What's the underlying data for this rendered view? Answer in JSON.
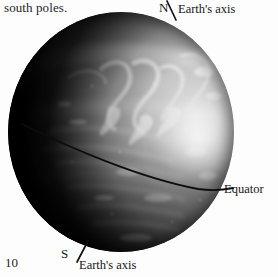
{
  "page": {
    "folio": "10",
    "background_color": "#ffffff",
    "ink_color": "#1a1a1a"
  },
  "body_text": {
    "fragment": "south poles."
  },
  "figure": {
    "style": "grayscale halftone photograph",
    "lighting": {
      "illumination_from": "upper-right",
      "highlight_color": "#f4f4f4",
      "terminator_color": "#060606",
      "midtone_color": "#8e8e8e"
    },
    "labels": {
      "north_pole": "N",
      "north_axis": "Earth's axis",
      "south_pole": "S",
      "south_axis": "Earth's axis",
      "equator": "Equator"
    },
    "annotations": {
      "axis_color": "#111111",
      "equator_color": "#0d0d0d",
      "equator_description": "curved line crossing the globe from left limb down to right limb"
    }
  }
}
